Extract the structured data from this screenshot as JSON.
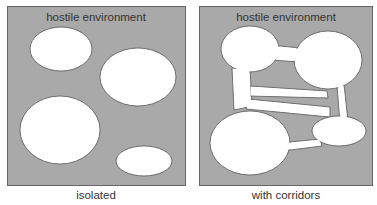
{
  "colors": {
    "environment": "#a9a9a9",
    "habitat": "#ffffff",
    "border": "#555555",
    "text": "#333333"
  },
  "panels": [
    {
      "title": "hostile environment",
      "caption": "isolated",
      "habitat_count": 4
    },
    {
      "title": "hostile environment",
      "caption": "with corridors",
      "habitat_count": 4,
      "corridor_count": 4
    }
  ]
}
